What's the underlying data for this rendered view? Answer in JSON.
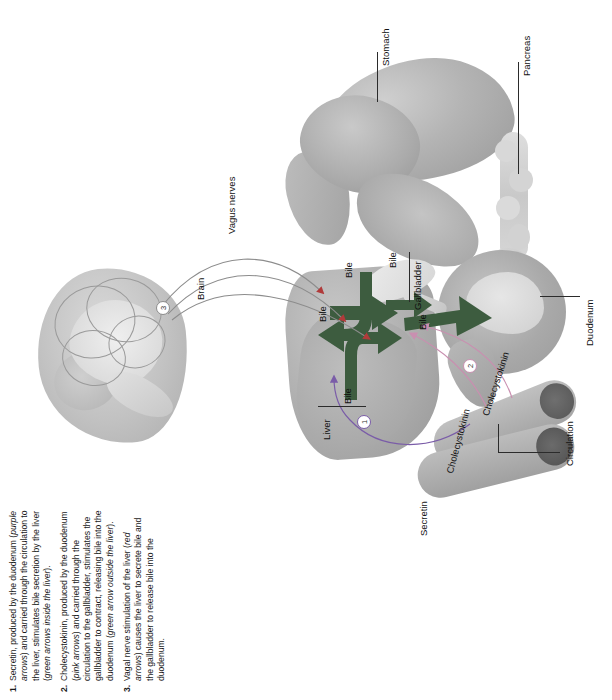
{
  "figure": {
    "orientation": "rotated-90-ccw"
  },
  "colors": {
    "bile_arrow": "#3d5c3f",
    "secretin_arrow": "#7a5ca8",
    "cck_arrow": "#c98fb0",
    "vagal_arrow": "#b03a3a",
    "organ_grey": "#b0b0b0",
    "leader_line": "#2b2b2b",
    "text": "#111111"
  },
  "labels": {
    "brain": "Brain",
    "vagus_nerves": "Vagus nerves",
    "stomach": "Stomach",
    "pancreas": "Pancreas",
    "gallbladder": "Gallbladder",
    "duodenum": "Duodenum",
    "liver": "Liver",
    "circulation": "Circulation",
    "secretin": "Secretin",
    "cholecystokinin_1": "Cholecystokinin",
    "cholecystokinin_2": "Cholecystokinin",
    "bile_1": "Bile",
    "bile_2": "Bile",
    "bile_3": "Bile",
    "bile_4": "Bile",
    "bile_5": "Bile"
  },
  "markers": {
    "m1": "1",
    "m2": "2",
    "m3": "3"
  },
  "caption": {
    "items": [
      {
        "num": "1.",
        "parts": [
          {
            "t": "Secretin, produced by the duodenum (",
            "i": false
          },
          {
            "t": "purple arrows",
            "i": true
          },
          {
            "t": ") and carried through the circulation to the liver, stimulates bile secretion by the liver (",
            "i": false
          },
          {
            "t": "green arrows inside the liver",
            "i": true
          },
          {
            "t": ").",
            "i": false
          }
        ]
      },
      {
        "num": "2.",
        "parts": [
          {
            "t": "Cholecystokinin, produced by the duodenum (",
            "i": false
          },
          {
            "t": "pink arrows",
            "i": true
          },
          {
            "t": ") and carried through the circulation to the gallbladder, stimulates the gallbladder to contract, releasing bile into the duodenum (",
            "i": false
          },
          {
            "t": "green arrow outside the liver",
            "i": true
          },
          {
            "t": ").",
            "i": false
          }
        ]
      },
      {
        "num": "3.",
        "parts": [
          {
            "t": "Vagal nerve stimulation of the liver (",
            "i": false
          },
          {
            "t": "red arrows",
            "i": true
          },
          {
            "t": ") causes the liver to secrete bile and the gallbladder to release bile into the duodenum.",
            "i": false
          }
        ]
      }
    ]
  }
}
